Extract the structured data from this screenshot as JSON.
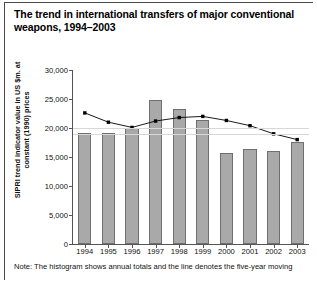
{
  "title": "The trend in international transfers of major conventional weapons, 1994–2003",
  "note": "Note: The histogram shows annual totals and the line denotes the five-year moving",
  "chart_data": {
    "type": "bar",
    "title": "The trend in international transfers of major conventional weapons, 1994–2003",
    "xlabel": "",
    "ylabel": "SIPRI trend indicator value in US $m. at constant (1990) prices",
    "categories": [
      "1994",
      "1995",
      "1996",
      "1997",
      "1998",
      "1999",
      "2000",
      "2001",
      "2002",
      "2003"
    ],
    "values": [
      19200,
      19200,
      20000,
      24900,
      23300,
      21400,
      15700,
      16400,
      16100,
      17600
    ],
    "ylim": [
      0,
      30000
    ],
    "yticks": [
      0,
      5000,
      10000,
      15000,
      20000,
      25000,
      30000
    ],
    "ytick_labels": [
      "0",
      "5,000",
      "10,000",
      "15,000",
      "20,000",
      "25,000",
      "30,000"
    ],
    "grid": true,
    "legend": "none",
    "series": [
      {
        "name": "Five-year moving average",
        "type": "line",
        "marker": "square",
        "color": "#000000",
        "values": [
          22600,
          21000,
          20100,
          21200,
          21800,
          22000,
          21300,
          20400,
          19000,
          18000
        ]
      }
    ]
  }
}
